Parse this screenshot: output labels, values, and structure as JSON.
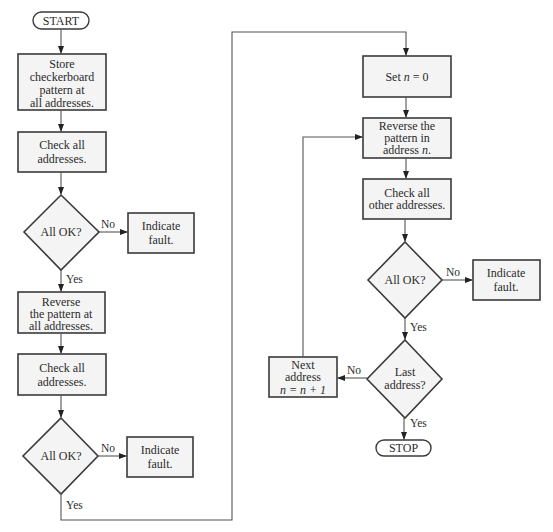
{
  "diagram": {
    "type": "flowchart",
    "left_column": {
      "start": "START",
      "store_box": [
        "Store",
        "checkerboard",
        "pattern at",
        "all addresses."
      ],
      "check_box_1": [
        "Check all",
        "addresses."
      ],
      "decision_1": "All OK?",
      "decision_1_no": "No",
      "decision_1_yes": "Yes",
      "fault_1": [
        "Indicate",
        "fault."
      ],
      "reverse_box": [
        "Reverse",
        "the pattern at",
        "all addresses."
      ],
      "check_box_2": [
        "Check all",
        "addresses."
      ],
      "decision_2": "All OK?",
      "decision_2_no": "No",
      "decision_2_yes": "Yes",
      "fault_2": [
        "Indicate",
        "fault."
      ]
    },
    "right_column": {
      "set_n_box": {
        "prefix": "Set ",
        "var": "n",
        "suffix": " = 0"
      },
      "reverse_n_box": {
        "line1": "Reverse the",
        "line2": "pattern in",
        "line3_prefix": "address ",
        "line3_var": "n",
        "line3_suffix": "."
      },
      "check_other_box": [
        "Check all",
        "other addresses."
      ],
      "decision_3": "All OK?",
      "decision_3_no": "No",
      "decision_3_yes": "Yes",
      "fault_3": [
        "Indicate",
        "fault."
      ],
      "decision_4": [
        "Last",
        "address?"
      ],
      "decision_4_no": "No",
      "decision_4_yes": "Yes",
      "next_box": {
        "line1": "Next",
        "line2": "address",
        "line3": "n = n + 1"
      },
      "stop": "STOP"
    },
    "colors": {
      "box_fill": "#f4f4f4",
      "stroke": "#3a3a3a",
      "text": "#2b2b2b"
    }
  }
}
